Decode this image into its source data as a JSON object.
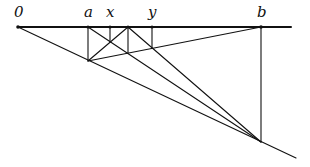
{
  "diagram": {
    "labels": {
      "origin": "0",
      "a": "a",
      "x": "x",
      "y": "y",
      "b": "b"
    },
    "stroke_color": "#111111",
    "background": "#ffffff"
  }
}
